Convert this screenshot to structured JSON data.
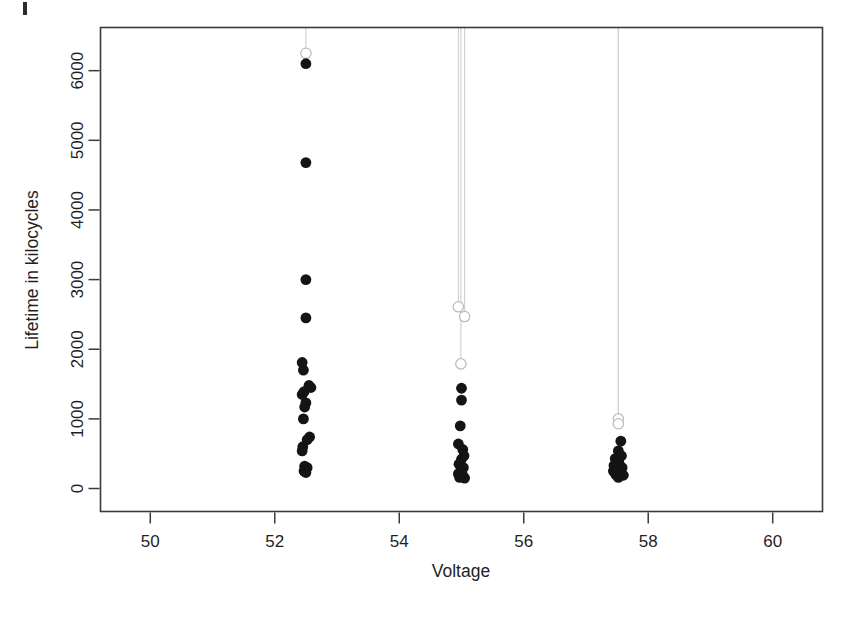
{
  "figure": {
    "kind": "scatter-censored-lifetime-plot",
    "background": "#ffffff",
    "point_color": "#141414",
    "censor_color": "#bcbcbc",
    "axis_color": "#3a3a3a"
  },
  "chart_data": {
    "type": "scatter",
    "title": "",
    "xlabel": "Voltage",
    "ylabel": "Lifetime in kilocycles",
    "xlim": [
      49.2,
      60.8
    ],
    "ylim": [
      -330,
      6620
    ],
    "xticks": [
      50,
      52,
      54,
      56,
      58,
      60
    ],
    "xticklabels": [
      "50",
      "52",
      "54",
      "56",
      "58",
      "60"
    ],
    "yticks": [
      0,
      1000,
      2000,
      3000,
      4000,
      5000,
      6000
    ],
    "yticklabels": [
      "0",
      "1000",
      "2000",
      "3000",
      "4000",
      "5000",
      "6000"
    ],
    "grid": false,
    "legend": null,
    "series": [
      {
        "name": "Failures",
        "marker": "filled-circle",
        "color": "#141414",
        "points": [
          {
            "x": 52.5,
            "y": 6100
          },
          {
            "x": 52.5,
            "y": 4680
          },
          {
            "x": 52.5,
            "y": 3000
          },
          {
            "x": 52.5,
            "y": 2450
          },
          {
            "x": 52.44,
            "y": 1810
          },
          {
            "x": 52.46,
            "y": 1700
          },
          {
            "x": 52.55,
            "y": 1480
          },
          {
            "x": 52.58,
            "y": 1450
          },
          {
            "x": 52.47,
            "y": 1390
          },
          {
            "x": 52.44,
            "y": 1350
          },
          {
            "x": 52.5,
            "y": 1230
          },
          {
            "x": 52.48,
            "y": 1170
          },
          {
            "x": 52.46,
            "y": 1000
          },
          {
            "x": 52.56,
            "y": 740
          },
          {
            "x": 52.52,
            "y": 700
          },
          {
            "x": 52.45,
            "y": 600
          },
          {
            "x": 52.44,
            "y": 540
          },
          {
            "x": 52.48,
            "y": 320
          },
          {
            "x": 52.52,
            "y": 300
          },
          {
            "x": 52.47,
            "y": 250
          },
          {
            "x": 52.5,
            "y": 230
          },
          {
            "x": 55.0,
            "y": 1440
          },
          {
            "x": 55.0,
            "y": 1270
          },
          {
            "x": 54.98,
            "y": 900
          },
          {
            "x": 54.95,
            "y": 640
          },
          {
            "x": 55.02,
            "y": 560
          },
          {
            "x": 55.04,
            "y": 470
          },
          {
            "x": 55.0,
            "y": 420
          },
          {
            "x": 54.96,
            "y": 350
          },
          {
            "x": 55.03,
            "y": 300
          },
          {
            "x": 54.99,
            "y": 260
          },
          {
            "x": 54.95,
            "y": 210
          },
          {
            "x": 55.02,
            "y": 190
          },
          {
            "x": 54.97,
            "y": 160
          },
          {
            "x": 55.05,
            "y": 150
          },
          {
            "x": 57.56,
            "y": 680
          },
          {
            "x": 57.52,
            "y": 540
          },
          {
            "x": 57.57,
            "y": 470
          },
          {
            "x": 57.47,
            "y": 430
          },
          {
            "x": 57.53,
            "y": 370
          },
          {
            "x": 57.45,
            "y": 330
          },
          {
            "x": 57.58,
            "y": 300
          },
          {
            "x": 57.5,
            "y": 280
          },
          {
            "x": 57.44,
            "y": 250
          },
          {
            "x": 57.55,
            "y": 230
          },
          {
            "x": 57.48,
            "y": 200
          },
          {
            "x": 57.6,
            "y": 190
          },
          {
            "x": 57.52,
            "y": 160
          }
        ]
      },
      {
        "name": "Censored (right-censored, line to limit)",
        "marker": "open-circle-with-line",
        "color": "#bcbcbc",
        "points": [
          {
            "x": 52.5,
            "y": 6250
          },
          {
            "x": 54.95,
            "y": 2610
          },
          {
            "x": 55.05,
            "y": 2470
          },
          {
            "x": 54.99,
            "y": 1790
          },
          {
            "x": 57.52,
            "y": 1000
          },
          {
            "x": 57.52,
            "y": 930
          }
        ]
      }
    ]
  }
}
